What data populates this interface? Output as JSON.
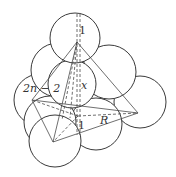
{
  "figure": {
    "labels": {
      "top_radius": "1",
      "edge": "2n − 2",
      "height": "x",
      "base_radius": "1",
      "circumradius": "R"
    }
  },
  "colors": {
    "stroke": "#3a3a3a",
    "background": "#ffffff"
  }
}
